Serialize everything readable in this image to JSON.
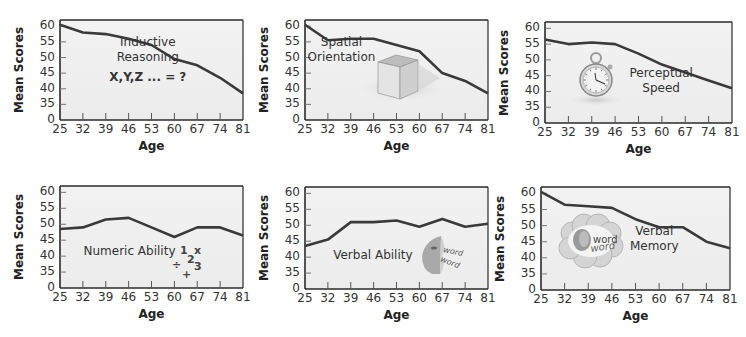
{
  "figure": {
    "panels": [
      {
        "id": "inductive-reasoning",
        "label_lines": [
          "Inductive",
          "Reasoning"
        ],
        "extra_text": "X,Y,Z ... = ?",
        "icon": "none"
      },
      {
        "id": "spatial-orientation",
        "label_lines": [
          "Spatial",
          "Orientation"
        ],
        "icon": "cube-icon"
      },
      {
        "id": "perceptual-speed",
        "label_lines": [
          "Perceptual",
          "Speed"
        ],
        "icon": "stopwatch-icon"
      },
      {
        "id": "numeric-ability",
        "label_lines": [
          "Numeric Ability"
        ],
        "extra_symbols": [
          "1",
          "x",
          "2",
          "÷",
          "3",
          "+"
        ],
        "icon": "math-symbols-icon"
      },
      {
        "id": "verbal-ability",
        "label_lines": [
          "Verbal Ability"
        ],
        "icon_text": [
          "word",
          "word"
        ],
        "icon": "speaking-head-icon"
      },
      {
        "id": "verbal-memory",
        "label_lines": [
          "Verbal",
          "Memory"
        ],
        "icon_text": [
          "word",
          "word"
        ],
        "icon": "thought-cloud-icon"
      }
    ],
    "common": {
      "xlabel": "Age",
      "ylabel": "Mean Scores",
      "x_ticks": [
        "25",
        "32",
        "39",
        "46",
        "53",
        "60",
        "67",
        "74",
        "81"
      ],
      "y_ticks": [
        "0",
        "35",
        "40",
        "45",
        "50",
        "55",
        "60"
      ]
    },
    "colors": {
      "line": "#3a3a3a",
      "plot_bg_top": "#f2f2f2",
      "plot_bg_bottom": "#ececec",
      "axis": "#2a2a2a"
    }
  },
  "chart_data": [
    {
      "type": "line",
      "title": "Inductive Reasoning",
      "annotation": "X,Y,Z ... = ?",
      "categories": [
        25,
        32,
        39,
        46,
        53,
        60,
        67,
        74,
        81
      ],
      "values": [
        60.5,
        58,
        57.5,
        56,
        54,
        49.5,
        47.5,
        43.5,
        38.5
      ],
      "xlabel": "Age",
      "ylabel": "Mean Scores",
      "ylim": [
        0,
        62
      ],
      "y_ticks": [
        0,
        35,
        40,
        45,
        50,
        55,
        60
      ],
      "axis_break": "y axis jumps from 0 to 35",
      "grid": false,
      "legend": "none"
    },
    {
      "type": "line",
      "title": "Spatial Orientation",
      "categories": [
        25,
        32,
        39,
        46,
        53,
        60,
        67,
        74,
        81
      ],
      "values": [
        60.5,
        55.5,
        56,
        56,
        54,
        52,
        45,
        42.5,
        38.5
      ],
      "xlabel": "Age",
      "ylabel": "Mean Scores",
      "ylim": [
        0,
        62
      ],
      "y_ticks": [
        0,
        35,
        40,
        45,
        50,
        55,
        60
      ],
      "axis_break": "y axis jumps from 0 to 35",
      "grid": false,
      "legend": "none"
    },
    {
      "type": "line",
      "title": "Perceptual Speed",
      "categories": [
        25,
        32,
        39,
        46,
        53,
        60,
        67,
        74,
        81
      ],
      "values": [
        56.5,
        55,
        55.5,
        55,
        52,
        48.5,
        46,
        43.5,
        41
      ],
      "xlabel": "Age",
      "ylabel": "Mean Scores",
      "ylim": [
        0,
        62
      ],
      "y_ticks": [
        0,
        35,
        40,
        45,
        50,
        55,
        60
      ],
      "axis_break": "y axis jumps from 0 to 35",
      "grid": false,
      "legend": "none"
    },
    {
      "type": "line",
      "title": "Numeric Ability",
      "categories": [
        25,
        32,
        39,
        46,
        53,
        60,
        67,
        74,
        81
      ],
      "values": [
        48.5,
        49,
        51.5,
        52,
        49,
        46,
        49,
        49,
        46.5
      ],
      "xlabel": "Age",
      "ylabel": "Mean Scores",
      "ylim": [
        0,
        62
      ],
      "y_ticks": [
        0,
        35,
        40,
        45,
        50,
        55,
        60
      ],
      "axis_break": "y axis jumps from 0 to 35",
      "grid": false,
      "legend": "none"
    },
    {
      "type": "line",
      "title": "Verbal Ability",
      "categories": [
        25,
        32,
        39,
        46,
        53,
        60,
        67,
        74,
        81
      ],
      "values": [
        43.5,
        45.5,
        51,
        51,
        51.5,
        49.5,
        52,
        49.5,
        50.5
      ],
      "xlabel": "Age",
      "ylabel": "Mean Scores",
      "ylim": [
        0,
        62
      ],
      "y_ticks": [
        0,
        35,
        40,
        45,
        50,
        55,
        60
      ],
      "axis_break": "y axis jumps from 0 to 35",
      "grid": false,
      "legend": "none"
    },
    {
      "type": "line",
      "title": "Verbal Memory",
      "categories": [
        25,
        32,
        39,
        46,
        53,
        60,
        67,
        74,
        81
      ],
      "values": [
        60.5,
        56.5,
        56,
        55.5,
        52,
        49.5,
        49.5,
        45,
        43
      ],
      "xlabel": "Age",
      "ylabel": "Mean Scores",
      "ylim": [
        0,
        62
      ],
      "y_ticks": [
        0,
        35,
        40,
        45,
        50,
        55,
        60
      ],
      "axis_break": "y axis jumps from 0 to 35",
      "grid": false,
      "legend": "none"
    }
  ]
}
